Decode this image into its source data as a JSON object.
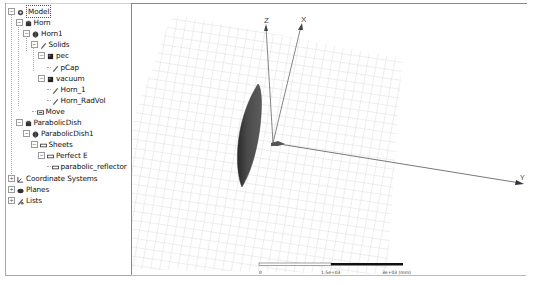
{
  "tree": {
    "nodes": [
      {
        "id": "model",
        "label": "Model",
        "level": 0,
        "expander": "minus",
        "icon": "model-icon",
        "selected": true
      },
      {
        "id": "horn",
        "label": "Horn",
        "level": 1,
        "expander": "minus",
        "icon": "part-group-icon"
      },
      {
        "id": "horn1",
        "label": "Horn1",
        "level": 2,
        "expander": "minus",
        "icon": "part-icon"
      },
      {
        "id": "solids",
        "label": "Solids",
        "level": 3,
        "expander": "minus",
        "icon": "solid-icon"
      },
      {
        "id": "pec",
        "label": "pec",
        "level": 4,
        "expander": "minus",
        "icon": "material-icon"
      },
      {
        "id": "pcap",
        "label": "pCap",
        "level": 5,
        "expander": null,
        "icon": "solid-icon"
      },
      {
        "id": "vacuum",
        "label": "vacuum",
        "level": 4,
        "expander": "minus",
        "icon": "material-icon"
      },
      {
        "id": "horn_1",
        "label": "Horn_1",
        "level": 5,
        "expander": null,
        "icon": "solid-icon"
      },
      {
        "id": "horn_radvol",
        "label": "Horn_RadVol",
        "level": 5,
        "expander": null,
        "icon": "solid-icon"
      },
      {
        "id": "move",
        "label": "Move",
        "level": 3,
        "expander": null,
        "icon": "move-icon"
      },
      {
        "id": "parabolicdish",
        "label": "ParabolicDish",
        "level": 1,
        "expander": "minus",
        "icon": "part-group-icon"
      },
      {
        "id": "parabolicdish1",
        "label": "ParabolicDish1",
        "level": 2,
        "expander": "minus",
        "icon": "part-icon"
      },
      {
        "id": "sheets",
        "label": "Sheets",
        "level": 3,
        "expander": "minus",
        "icon": "sheet-icon"
      },
      {
        "id": "perfecte",
        "label": "Perfect E",
        "level": 4,
        "expander": "minus",
        "icon": "sheet-icon"
      },
      {
        "id": "parabolic_reflector",
        "label": "parabolic_reflector",
        "level": 5,
        "expander": null,
        "icon": "sheet-icon"
      },
      {
        "id": "coord",
        "label": "Coordinate Systems",
        "level": 0,
        "expander": "plus",
        "icon": "coordinate-icon"
      },
      {
        "id": "planes",
        "label": "Planes",
        "level": 0,
        "expander": "plus",
        "icon": "plane-icon"
      },
      {
        "id": "lists",
        "label": "Lists",
        "level": 0,
        "expander": "plus",
        "icon": "list-icon"
      }
    ]
  },
  "viewport": {
    "axes": {
      "z_label": "Z",
      "x_label": "X",
      "y_label": "Y"
    },
    "scale_bar": {
      "labels": [
        "0",
        "1.5e+03",
        "3e+03 (mm)"
      ]
    },
    "colors": {
      "grid": "#dcdcdc",
      "reflector": "#4a4a4a",
      "axis": "#555555"
    }
  }
}
